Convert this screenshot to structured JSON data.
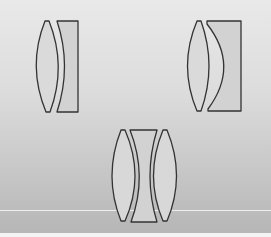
{
  "diagram": {
    "type": "lens-cross-sections",
    "groups": [
      {
        "name": "doublet-left",
        "elements": [
          {
            "shape": "biconvex"
          },
          {
            "shape": "plano-concave"
          }
        ]
      },
      {
        "name": "doublet-right",
        "elements": [
          {
            "shape": "biconvex"
          },
          {
            "shape": "plano-concave-deep"
          }
        ]
      },
      {
        "name": "triplet-bottom",
        "elements": [
          {
            "shape": "biconvex"
          },
          {
            "shape": "biconcave"
          },
          {
            "shape": "biconvex"
          }
        ]
      }
    ],
    "colors": {
      "background_top": "#e9e9e9",
      "background_bottom": "#b6b6b6",
      "lens_stroke": "#333333",
      "convex_fill": "#d9d9d9",
      "concave_fill": "#cfcfcf"
    }
  }
}
